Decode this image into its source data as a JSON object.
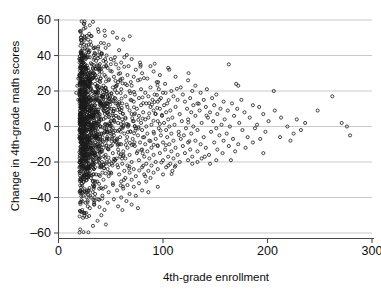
{
  "chart_data": {
    "type": "scatter",
    "title": "",
    "xlabel": "4th-grade enrollment",
    "ylabel": "Change in 4th-grade math scores",
    "xlim": [
      0,
      300
    ],
    "ylim": [
      -60,
      60
    ],
    "xticks": [
      0,
      100,
      200,
      300
    ],
    "yticks": [
      -60,
      -40,
      -20,
      0,
      20,
      40,
      60
    ],
    "xtick_labels": [
      "0",
      "100",
      "200",
      "300"
    ],
    "ytick_labels": [
      "–60",
      "–40",
      "–20",
      "0",
      "20",
      "40",
      "60"
    ],
    "grid": "horizontal",
    "legend": "none",
    "marker": "open-circle",
    "marker_size_px": 3,
    "marker_color": "#1a1a1a",
    "n_points": 1700,
    "points": [
      [
        33,
        59
      ],
      [
        44,
        54
      ],
      [
        52,
        53
      ],
      [
        27,
        51
      ],
      [
        31,
        51
      ],
      [
        56,
        50
      ],
      [
        62,
        49
      ],
      [
        48,
        46
      ],
      [
        38,
        45
      ],
      [
        25,
        44
      ],
      [
        58,
        43
      ],
      [
        29,
        42
      ],
      [
        41,
        41
      ],
      [
        35,
        41
      ],
      [
        22,
        40
      ],
      [
        46,
        40
      ],
      [
        54,
        39
      ],
      [
        30,
        39
      ],
      [
        63,
        39
      ],
      [
        26,
        38
      ],
      [
        50,
        38
      ],
      [
        70,
        38
      ],
      [
        36,
        37
      ],
      [
        43,
        37
      ],
      [
        24,
        36
      ],
      [
        60,
        36
      ],
      [
        78,
        36
      ],
      [
        32,
        35
      ],
      [
        55,
        35
      ],
      [
        21,
        34
      ],
      [
        67,
        34
      ],
      [
        88,
        34
      ],
      [
        163,
        35
      ],
      [
        28,
        33
      ],
      [
        47,
        33
      ],
      [
        105,
        33
      ],
      [
        106,
        32
      ],
      [
        39,
        32
      ],
      [
        74,
        32
      ],
      [
        23,
        31
      ],
      [
        51,
        31
      ],
      [
        91,
        31
      ],
      [
        34,
        30
      ],
      [
        59,
        30
      ],
      [
        80,
        30
      ],
      [
        20,
        29
      ],
      [
        44,
        29
      ],
      [
        66,
        29
      ],
      [
        97,
        29
      ],
      [
        27,
        28
      ],
      [
        53,
        28
      ],
      [
        72,
        28
      ],
      [
        112,
        28
      ],
      [
        19,
        27
      ],
      [
        40,
        27
      ],
      [
        61,
        27
      ],
      [
        85,
        27
      ],
      [
        30,
        26
      ],
      [
        48,
        26
      ],
      [
        76,
        26
      ],
      [
        124,
        26
      ],
      [
        22,
        25
      ],
      [
        57,
        25
      ],
      [
        94,
        25
      ],
      [
        170,
        24
      ],
      [
        172,
        23
      ],
      [
        35,
        24
      ],
      [
        64,
        24
      ],
      [
        102,
        24
      ],
      [
        131,
        23
      ],
      [
        18,
        23
      ],
      [
        43,
        23
      ],
      [
        70,
        23
      ],
      [
        88,
        22
      ],
      [
        26,
        22
      ],
      [
        52,
        22
      ],
      [
        117,
        22
      ],
      [
        142,
        21
      ],
      [
        31,
        21
      ],
      [
        60,
        21
      ],
      [
        79,
        21
      ],
      [
        96,
        21
      ],
      [
        21,
        20
      ],
      [
        46,
        20
      ],
      [
        68,
        20
      ],
      [
        108,
        20
      ],
      [
        128,
        20
      ],
      [
        206,
        20
      ],
      [
        17,
        19
      ],
      [
        38,
        19
      ],
      [
        56,
        19
      ],
      [
        83,
        19
      ],
      [
        100,
        19
      ],
      [
        136,
        19
      ],
      [
        28,
        18
      ],
      [
        49,
        18
      ],
      [
        73,
        18
      ],
      [
        92,
        18
      ],
      [
        119,
        18
      ],
      [
        151,
        18
      ],
      [
        23,
        17
      ],
      [
        42,
        17
      ],
      [
        64,
        17
      ],
      [
        86,
        17
      ],
      [
        110,
        17
      ],
      [
        262,
        17
      ],
      [
        33,
        16
      ],
      [
        54,
        16
      ],
      [
        77,
        16
      ],
      [
        98,
        16
      ],
      [
        126,
        16
      ],
      [
        147,
        16
      ],
      [
        19,
        15
      ],
      [
        45,
        15
      ],
      [
        69,
        15
      ],
      [
        90,
        15
      ],
      [
        114,
        15
      ],
      [
        139,
        15
      ],
      [
        175,
        15
      ],
      [
        29,
        14
      ],
      [
        50,
        14
      ],
      [
        72,
        14
      ],
      [
        95,
        14
      ],
      [
        121,
        14
      ],
      [
        158,
        14
      ],
      [
        25,
        13
      ],
      [
        41,
        13
      ],
      [
        61,
        13
      ],
      [
        84,
        13
      ],
      [
        104,
        13
      ],
      [
        133,
        13
      ],
      [
        166,
        13
      ],
      [
        35,
        12
      ],
      [
        57,
        12
      ],
      [
        79,
        12
      ],
      [
        101,
        12
      ],
      [
        129,
        12
      ],
      [
        149,
        12
      ],
      [
        186,
        12
      ],
      [
        21,
        11
      ],
      [
        47,
        11
      ],
      [
        66,
        11
      ],
      [
        88,
        11
      ],
      [
        112,
        11
      ],
      [
        141,
        11
      ],
      [
        192,
        11
      ],
      [
        31,
        10
      ],
      [
        53,
        10
      ],
      [
        75,
        10
      ],
      [
        97,
        10
      ],
      [
        123,
        10
      ],
      [
        155,
        10
      ],
      [
        171,
        10
      ],
      [
        248,
        9
      ],
      [
        26,
        9
      ],
      [
        44,
        9
      ],
      [
        68,
        9
      ],
      [
        91,
        9
      ],
      [
        107,
        9
      ],
      [
        135,
        9
      ],
      [
        162,
        9
      ],
      [
        207,
        9
      ],
      [
        37,
        8
      ],
      [
        59,
        8
      ],
      [
        81,
        8
      ],
      [
        103,
        8
      ],
      [
        127,
        8
      ],
      [
        145,
        8
      ],
      [
        178,
        8
      ],
      [
        22,
        7
      ],
      [
        48,
        7
      ],
      [
        70,
        7
      ],
      [
        93,
        7
      ],
      [
        116,
        7
      ],
      [
        152,
        7
      ],
      [
        196,
        7
      ],
      [
        33,
        6
      ],
      [
        55,
        6
      ],
      [
        77,
        6
      ],
      [
        99,
        6
      ],
      [
        131,
        6
      ],
      [
        168,
        6
      ],
      [
        213,
        5
      ],
      [
        27,
        5
      ],
      [
        45,
        5
      ],
      [
        64,
        5
      ],
      [
        86,
        5
      ],
      [
        109,
        5
      ],
      [
        143,
        5
      ],
      [
        183,
        5
      ],
      [
        39,
        4
      ],
      [
        61,
        4
      ],
      [
        83,
        4
      ],
      [
        105,
        4
      ],
      [
        124,
        4
      ],
      [
        159,
        4
      ],
      [
        228,
        4
      ],
      [
        23,
        3
      ],
      [
        50,
        3
      ],
      [
        72,
        3
      ],
      [
        95,
        3
      ],
      [
        118,
        3
      ],
      [
        148,
        3
      ],
      [
        201,
        3
      ],
      [
        34,
        2
      ],
      [
        57,
        2
      ],
      [
        79,
        2
      ],
      [
        101,
        2
      ],
      [
        137,
        2
      ],
      [
        173,
        2
      ],
      [
        236,
        2
      ],
      [
        28,
        1
      ],
      [
        46,
        1
      ],
      [
        67,
        1
      ],
      [
        89,
        1
      ],
      [
        111,
        1
      ],
      [
        156,
        1
      ],
      [
        190,
        1
      ],
      [
        271,
        2
      ],
      [
        40,
        0
      ],
      [
        62,
        0
      ],
      [
        84,
        0
      ],
      [
        106,
        0
      ],
      [
        129,
        0
      ],
      [
        164,
        0
      ],
      [
        219,
        0
      ],
      [
        276,
        0
      ],
      [
        24,
        -1
      ],
      [
        52,
        -1
      ],
      [
        74,
        -1
      ],
      [
        96,
        -1
      ],
      [
        122,
        -1
      ],
      [
        151,
        -1
      ],
      [
        188,
        -1
      ],
      [
        35,
        -2
      ],
      [
        58,
        -2
      ],
      [
        80,
        -2
      ],
      [
        103,
        -2
      ],
      [
        133,
        -2
      ],
      [
        176,
        -2
      ],
      [
        232,
        -2
      ],
      [
        29,
        -3
      ],
      [
        47,
        -3
      ],
      [
        69,
        -3
      ],
      [
        91,
        -3
      ],
      [
        115,
        -3
      ],
      [
        146,
        -3
      ],
      [
        198,
        -3
      ],
      [
        41,
        -4
      ],
      [
        63,
        -4
      ],
      [
        85,
        -4
      ],
      [
        108,
        -4
      ],
      [
        127,
        -4
      ],
      [
        161,
        -4
      ],
      [
        225,
        -4
      ],
      [
        25,
        -5
      ],
      [
        53,
        -5
      ],
      [
        76,
        -5
      ],
      [
        98,
        -5
      ],
      [
        120,
        -5
      ],
      [
        154,
        -5
      ],
      [
        279,
        -5
      ],
      [
        36,
        -6
      ],
      [
        59,
        -6
      ],
      [
        82,
        -6
      ],
      [
        104,
        -6
      ],
      [
        139,
        -6
      ],
      [
        181,
        -6
      ],
      [
        212,
        -6
      ],
      [
        30,
        -7
      ],
      [
        48,
        -7
      ],
      [
        71,
        -7
      ],
      [
        93,
        -7
      ],
      [
        117,
        -7
      ],
      [
        167,
        -7
      ],
      [
        193,
        -7
      ],
      [
        42,
        -8
      ],
      [
        65,
        -8
      ],
      [
        87,
        -8
      ],
      [
        110,
        -8
      ],
      [
        131,
        -8
      ],
      [
        158,
        -8
      ],
      [
        222,
        -8
      ],
      [
        26,
        -9
      ],
      [
        55,
        -9
      ],
      [
        78,
        -9
      ],
      [
        100,
        -9
      ],
      [
        124,
        -9
      ],
      [
        149,
        -9
      ],
      [
        186,
        -9
      ],
      [
        37,
        -10
      ],
      [
        60,
        -10
      ],
      [
        83,
        -10
      ],
      [
        106,
        -10
      ],
      [
        136,
        -10
      ],
      [
        172,
        -10
      ],
      [
        31,
        -11
      ],
      [
        50,
        -11
      ],
      [
        73,
        -11
      ],
      [
        95,
        -11
      ],
      [
        119,
        -11
      ],
      [
        163,
        -11
      ],
      [
        43,
        -12
      ],
      [
        66,
        -12
      ],
      [
        89,
        -12
      ],
      [
        112,
        -12
      ],
      [
        141,
        -12
      ],
      [
        179,
        -12
      ],
      [
        27,
        -13
      ],
      [
        57,
        -13
      ],
      [
        80,
        -13
      ],
      [
        102,
        -13
      ],
      [
        126,
        -13
      ],
      [
        152,
        -13
      ],
      [
        38,
        -14
      ],
      [
        62,
        -14
      ],
      [
        85,
        -14
      ],
      [
        108,
        -14
      ],
      [
        133,
        -14
      ],
      [
        169,
        -14
      ],
      [
        32,
        -15
      ],
      [
        52,
        -15
      ],
      [
        75,
        -15
      ],
      [
        97,
        -15
      ],
      [
        121,
        -15
      ],
      [
        157,
        -15
      ],
      [
        45,
        -16
      ],
      [
        68,
        -16
      ],
      [
        91,
        -16
      ],
      [
        114,
        -16
      ],
      [
        144,
        -16
      ],
      [
        140,
        -17
      ],
      [
        28,
        -17
      ],
      [
        59,
        -17
      ],
      [
        82,
        -17
      ],
      [
        105,
        -17
      ],
      [
        128,
        -17
      ],
      [
        196,
        -15
      ],
      [
        39,
        -18
      ],
      [
        64,
        -18
      ],
      [
        87,
        -18
      ],
      [
        110,
        -18
      ],
      [
        137,
        -18
      ],
      [
        151,
        -19
      ],
      [
        33,
        -19
      ],
      [
        54,
        -19
      ],
      [
        77,
        -19
      ],
      [
        100,
        -19
      ],
      [
        124,
        -19
      ],
      [
        165,
        -19
      ],
      [
        46,
        -20
      ],
      [
        70,
        -20
      ],
      [
        93,
        -20
      ],
      [
        116,
        -20
      ],
      [
        133,
        -20
      ],
      [
        145,
        -21
      ],
      [
        29,
        -21
      ],
      [
        61,
        -21
      ],
      [
        84,
        -21
      ],
      [
        107,
        -21
      ],
      [
        128,
        -21
      ],
      [
        105,
        -22
      ],
      [
        41,
        -22
      ],
      [
        66,
        -22
      ],
      [
        89,
        -22
      ],
      [
        112,
        -22
      ],
      [
        35,
        -23
      ],
      [
        57,
        -23
      ],
      [
        80,
        -23
      ],
      [
        103,
        -23
      ],
      [
        47,
        -24
      ],
      [
        72,
        -24
      ],
      [
        95,
        -24
      ],
      [
        30,
        -25
      ],
      [
        63,
        -25
      ],
      [
        86,
        -25
      ],
      [
        109,
        -25
      ],
      [
        42,
        -26
      ],
      [
        68,
        -26
      ],
      [
        91,
        -26
      ],
      [
        36,
        -27
      ],
      [
        58,
        -27
      ],
      [
        82,
        -27
      ],
      [
        100,
        -27
      ],
      [
        48,
        -28
      ],
      [
        74,
        -28
      ],
      [
        31,
        -29
      ],
      [
        64,
        -29
      ],
      [
        88,
        -29
      ],
      [
        43,
        -30
      ],
      [
        70,
        -30
      ],
      [
        37,
        -31
      ],
      [
        60,
        -31
      ],
      [
        84,
        -31
      ],
      [
        52,
        -32
      ],
      [
        77,
        -32
      ],
      [
        33,
        -33
      ],
      [
        66,
        -33
      ],
      [
        45,
        -34
      ],
      [
        72,
        -34
      ],
      [
        95,
        -34
      ],
      [
        39,
        -35
      ],
      [
        62,
        -35
      ],
      [
        29,
        -36
      ],
      [
        56,
        -36
      ],
      [
        80,
        -36
      ],
      [
        48,
        -37
      ],
      [
        86,
        -37
      ],
      [
        35,
        -38
      ],
      [
        68,
        -38
      ],
      [
        42,
        -39
      ],
      [
        74,
        -39
      ],
      [
        31,
        -40
      ],
      [
        60,
        -40
      ],
      [
        53,
        -41
      ],
      [
        38,
        -41
      ],
      [
        65,
        -42
      ],
      [
        26,
        -43
      ],
      [
        47,
        -43
      ],
      [
        70,
        -44
      ],
      [
        34,
        -44
      ],
      [
        28,
        -45
      ],
      [
        57,
        -45
      ],
      [
        76,
        -46
      ],
      [
        30,
        -46
      ],
      [
        44,
        -47
      ],
      [
        41,
        -50
      ],
      [
        33,
        -56
      ]
    ]
  },
  "axis": {
    "x_title": "4th-grade enrollment",
    "y_title": "Change in 4th-grade math scores"
  },
  "style": {
    "background": "#ffffff",
    "gridline_color": "#c9c9c9",
    "axis_color": "#4a4a4a",
    "marker_stroke": "#1a1a1a",
    "text_color": "#0d0d0d"
  }
}
